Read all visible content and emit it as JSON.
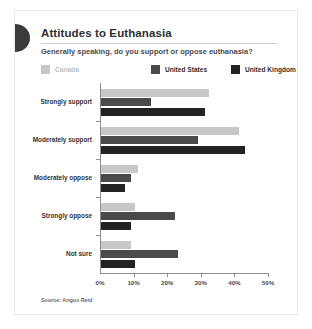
{
  "card": {
    "title": "Attitudes to Euthanasia",
    "subtitle": "Generally speaking, do you support or oppose euthanasia?",
    "source": "Source: Angus Reid"
  },
  "legend": {
    "position": "top",
    "items": [
      {
        "label": "Canada",
        "color": "#c8c8c8"
      },
      {
        "label": "United States",
        "color": "#4a4a4a"
      },
      {
        "label": "United Kingdom",
        "color": "#232323"
      }
    ]
  },
  "axis": {
    "ticks": [
      "0%",
      "10%",
      "20%",
      "30%",
      "40%",
      "50%"
    ],
    "tick_values": [
      0,
      10,
      20,
      30,
      40,
      50
    ]
  },
  "chart_data": {
    "type": "bar",
    "orientation": "horizontal",
    "title": "Attitudes to Euthanasia",
    "subtitle": "Generally speaking, do you support or oppose euthanasia?",
    "xlabel": "",
    "ylabel": "",
    "xlim": [
      0,
      50
    ],
    "grid": false,
    "legend_position": "top",
    "source": "Source: Angus Reid",
    "categories": [
      "Strongly support",
      "Moderately support",
      "Moderately oppose",
      "Strongly oppose",
      "Not sure"
    ],
    "series": [
      {
        "name": "Canada",
        "color": "#c8c8c8",
        "values": [
          32,
          41,
          11,
          10,
          9
        ]
      },
      {
        "name": "United States",
        "color": "#4a4a4a",
        "values": [
          15,
          29,
          9,
          22,
          23
        ]
      },
      {
        "name": "United Kingdom",
        "color": "#232323",
        "values": [
          31,
          43,
          7,
          9,
          10
        ]
      }
    ]
  }
}
